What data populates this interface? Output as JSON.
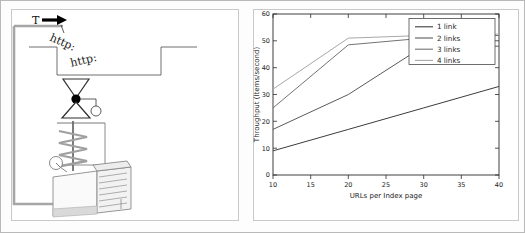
{
  "figure": {
    "panels": [
      "schematic-diagram",
      "throughput-line-chart"
    ]
  },
  "diagram": {
    "title": "",
    "labels": {
      "thread_label": "T",
      "arrow": "➔",
      "http_label_1": "http:",
      "http_label_2": "http:"
    },
    "components": [
      "feedback-loop-wire",
      "index-page-step-outline",
      "funnel-top",
      "junction-dot",
      "funnel-bottom",
      "small-gauge-circle",
      "coil-spring",
      "pressure-gauge",
      "server-machine-box"
    ],
    "colors": {
      "outline": "#3a3a3a",
      "light_outline": "#b0b0b0",
      "wire": "#9a9a9a",
      "fill": "#ffffff",
      "dot": "#000000"
    }
  },
  "chart_data": {
    "type": "line",
    "title": "",
    "xlabel": "URLs per Index page",
    "ylabel": "Throughput (Items/second)",
    "xlim": [
      10,
      40
    ],
    "ylim": [
      0,
      60
    ],
    "xticks": [
      10,
      15,
      20,
      25,
      30,
      35,
      40
    ],
    "yticks": [
      0,
      10,
      20,
      30,
      40,
      50,
      60
    ],
    "xticklabels": [
      "10",
      "15",
      "20",
      "25",
      "30",
      "35",
      "40"
    ],
    "yticklabels": [
      "0",
      "10",
      "20",
      "30",
      "40",
      "50",
      "60"
    ],
    "grid": false,
    "legend_position": "upper right",
    "legend_entries": [
      "1 link",
      "2 links",
      "3 links",
      "4 links"
    ],
    "x": [
      10,
      20,
      30,
      40
    ],
    "series": [
      {
        "name": "1 link",
        "values": [
          9,
          17,
          25,
          33
        ],
        "color": "#3c3c3c"
      },
      {
        "name": "2 links",
        "values": [
          17,
          30,
          48,
          48
        ],
        "color": "#5a5a5a"
      },
      {
        "name": "3 links",
        "values": [
          25,
          48.5,
          51,
          52
        ],
        "color": "#737373"
      },
      {
        "name": "4 links",
        "values": [
          32,
          51,
          52,
          52.5
        ],
        "color": "#a8a8a8"
      }
    ]
  }
}
